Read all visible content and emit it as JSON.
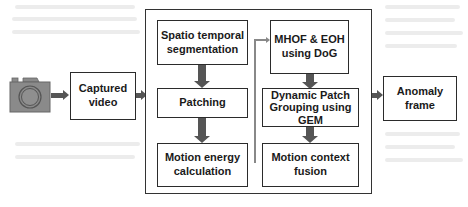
{
  "diagram": {
    "input": {
      "icon": "camera-icon",
      "color": "#8a8a8a"
    },
    "captured_video": {
      "label": "Captured\nvideo"
    },
    "left_column": [
      {
        "label": "Spatio temporal\nsegmentation"
      },
      {
        "label": "Patching"
      },
      {
        "label": "Motion energy\ncalculation"
      }
    ],
    "right_column": [
      {
        "label": "MHOF & EOH\nusing DoG"
      },
      {
        "label": "Dynamic Patch\nGrouping using\nGEM"
      },
      {
        "label": "Motion context\nfusion"
      }
    ],
    "output": {
      "label": "Anomaly\nframe"
    },
    "colors": {
      "box_border": "#2b2b2b",
      "arrow": "#555555",
      "connector": "#888888"
    }
  }
}
